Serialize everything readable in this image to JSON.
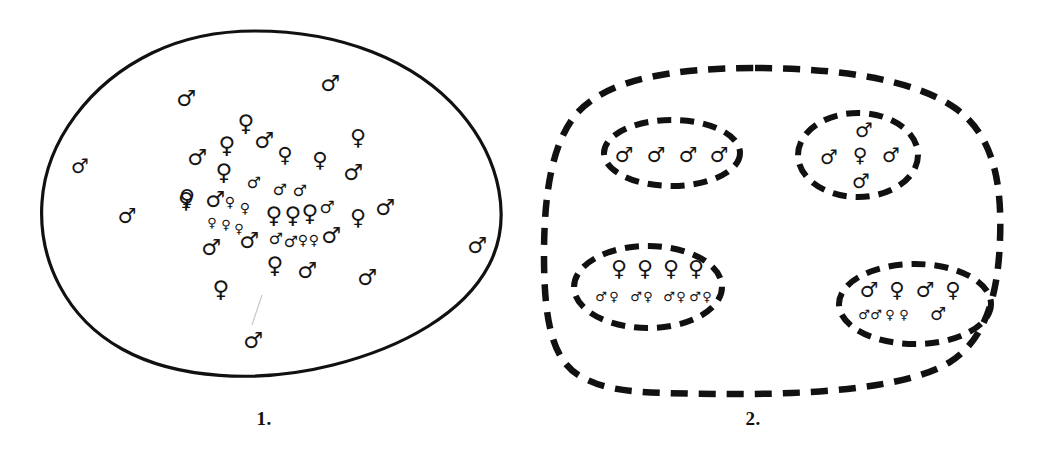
{
  "figure": {
    "background_color": "#ffffff",
    "ink_color": "#111111",
    "symbols": {
      "male_glyph": "♂",
      "female_glyph": "♀",
      "male_name": "male-symbol",
      "female_name": "female-symbol"
    }
  },
  "panels": [
    {
      "id": "panel-1",
      "caption": "1.",
      "boundary_style": "solid",
      "boundary_shape": "egg-oval",
      "description": "Single unstructured population: male and female symbols scattered, densest in the centre.",
      "member_counts": {
        "male": 33,
        "female": 28,
        "total": 61
      },
      "members": [
        {
          "sex": "male",
          "x": 330,
          "y": 83,
          "size": 22
        },
        {
          "sex": "male",
          "x": 186,
          "y": 98,
          "size": 22
        },
        {
          "sex": "male",
          "x": 80,
          "y": 166,
          "size": 20
        },
        {
          "sex": "female",
          "x": 246,
          "y": 123,
          "size": 23
        },
        {
          "sex": "male",
          "x": 264,
          "y": 140,
          "size": 22
        },
        {
          "sex": "female",
          "x": 358,
          "y": 137,
          "size": 22
        },
        {
          "sex": "female",
          "x": 227,
          "y": 145,
          "size": 23
        },
        {
          "sex": "male",
          "x": 197,
          "y": 157,
          "size": 22
        },
        {
          "sex": "female",
          "x": 285,
          "y": 155,
          "size": 21
        },
        {
          "sex": "female",
          "x": 320,
          "y": 160,
          "size": 21
        },
        {
          "sex": "female",
          "x": 224,
          "y": 172,
          "size": 23
        },
        {
          "sex": "male",
          "x": 353,
          "y": 172,
          "size": 22
        },
        {
          "sex": "male",
          "x": 127,
          "y": 216,
          "size": 21
        },
        {
          "sex": "female",
          "x": 187,
          "y": 197,
          "size": 22
        },
        {
          "sex": "male",
          "x": 254,
          "y": 182,
          "size": 16
        },
        {
          "sex": "male",
          "x": 280,
          "y": 189,
          "size": 16
        },
        {
          "sex": "male",
          "x": 300,
          "y": 190,
          "size": 16
        },
        {
          "sex": "female",
          "x": 186,
          "y": 200,
          "size": 22
        },
        {
          "sex": "male",
          "x": 215,
          "y": 199,
          "size": 22
        },
        {
          "sex": "female",
          "x": 230,
          "y": 202,
          "size": 14
        },
        {
          "sex": "female",
          "x": 245,
          "y": 208,
          "size": 14
        },
        {
          "sex": "female",
          "x": 212,
          "y": 222,
          "size": 13
        },
        {
          "sex": "female",
          "x": 226,
          "y": 224,
          "size": 13
        },
        {
          "sex": "female",
          "x": 239,
          "y": 228,
          "size": 13
        },
        {
          "sex": "female",
          "x": 274,
          "y": 215,
          "size": 23
        },
        {
          "sex": "female",
          "x": 293,
          "y": 215,
          "size": 23
        },
        {
          "sex": "female",
          "x": 310,
          "y": 213,
          "size": 23
        },
        {
          "sex": "male",
          "x": 327,
          "y": 207,
          "size": 17
        },
        {
          "sex": "female",
          "x": 358,
          "y": 217,
          "size": 22
        },
        {
          "sex": "male",
          "x": 385,
          "y": 207,
          "size": 22
        },
        {
          "sex": "male",
          "x": 249,
          "y": 240,
          "size": 22
        },
        {
          "sex": "male",
          "x": 211,
          "y": 247,
          "size": 22
        },
        {
          "sex": "male",
          "x": 276,
          "y": 238,
          "size": 16
        },
        {
          "sex": "male",
          "x": 291,
          "y": 241,
          "size": 16
        },
        {
          "sex": "female",
          "x": 303,
          "y": 240,
          "size": 14
        },
        {
          "sex": "female",
          "x": 314,
          "y": 240,
          "size": 14
        },
        {
          "sex": "male",
          "x": 331,
          "y": 235,
          "size": 22
        },
        {
          "sex": "female",
          "x": 275,
          "y": 265,
          "size": 23
        },
        {
          "sex": "male",
          "x": 307,
          "y": 270,
          "size": 22
        },
        {
          "sex": "male",
          "x": 367,
          "y": 277,
          "size": 22
        },
        {
          "sex": "female",
          "x": 221,
          "y": 289,
          "size": 23
        },
        {
          "sex": "male",
          "x": 253,
          "y": 340,
          "size": 22
        },
        {
          "sex": "male",
          "x": 477,
          "y": 245,
          "size": 22
        }
      ]
    },
    {
      "id": "panel-2",
      "caption": "2.",
      "boundary_style": "dashed",
      "boundary_shape": "rounded-rectangle",
      "description": "Subdivided population: four dashed sub-population groups inside one dashed metapopulation boundary.",
      "subgroups": [
        {
          "id": "subgroup-top-left",
          "label": "all-male group",
          "composition": {
            "male": 4,
            "female": 0
          },
          "rows": [
            {
              "size": 21,
              "items": [
                "male",
                "male",
                "male",
                "male"
              ]
            }
          ]
        },
        {
          "id": "subgroup-top-right",
          "label": "one female with four males",
          "composition": {
            "male": 4,
            "female": 1
          },
          "rows": [
            {
              "size": 20,
              "items": [
                "male"
              ]
            },
            {
              "size": 20,
              "items": [
                "male",
                "female",
                "male"
              ]
            },
            {
              "size": 20,
              "items": [
                "male"
              ]
            }
          ]
        },
        {
          "id": "subgroup-bottom-left",
          "label": "four females with offspring pairs",
          "composition": {
            "male": 4,
            "female": 8
          },
          "rows": [
            {
              "size": 22,
              "items": [
                "female",
                "female",
                "female",
                "female"
              ]
            },
            {
              "size": 13,
              "items": [
                "male",
                "female",
                "male",
                "female",
                "male",
                "female",
                "male",
                "female"
              ]
            }
          ]
        },
        {
          "id": "subgroup-bottom-right",
          "label": "mixed pair group with offspring",
          "composition": {
            "male": 5,
            "female": 4
          },
          "rows": [
            {
              "size": 21,
              "items": [
                "male",
                "female",
                "male",
                "female"
              ]
            },
            {
              "size": 13,
              "items": [
                "male",
                "male",
                "female",
                "female"
              ]
            },
            {
              "size": 18,
              "items": [
                "male"
              ]
            }
          ]
        }
      ]
    }
  ]
}
